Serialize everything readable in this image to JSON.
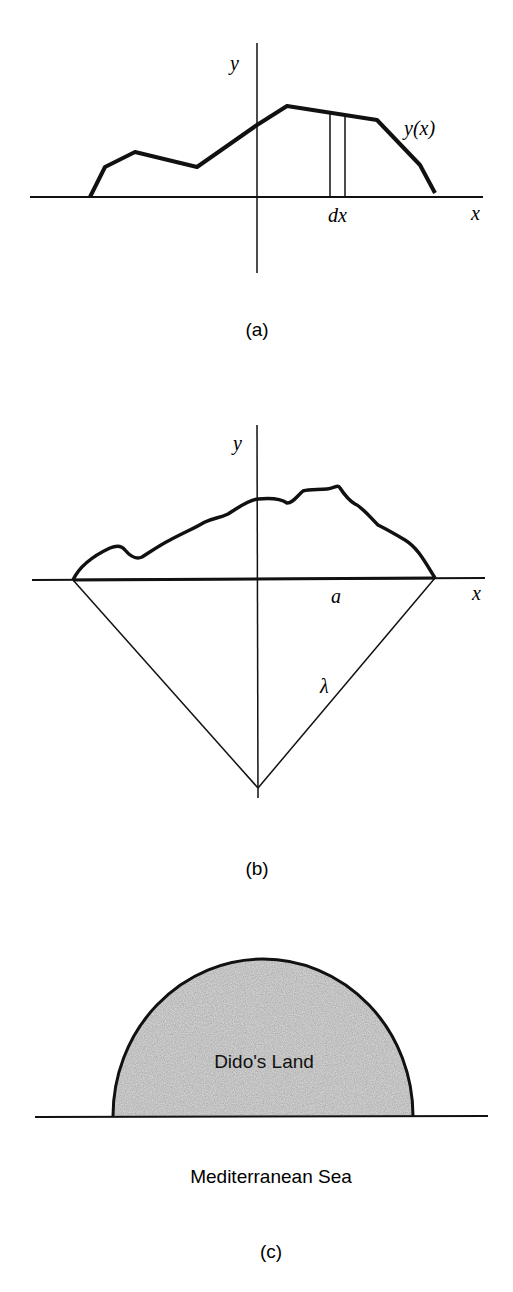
{
  "figure_a": {
    "caption": "(a)",
    "y_axis_label": "y",
    "x_axis_label": "x",
    "curve_label": "y(x)",
    "strip_label": "dx"
  },
  "figure_b": {
    "caption": "(b)",
    "y_axis_label": "y",
    "x_axis_label": "x",
    "half_width_label": "a",
    "side_label": "λ"
  },
  "figure_c": {
    "caption": "(c)",
    "region_label": "Dido's Land",
    "sea_label": "Mediterranean Sea"
  },
  "colors": {
    "ink": "#111111",
    "land_fill": "#d4d4d4"
  }
}
